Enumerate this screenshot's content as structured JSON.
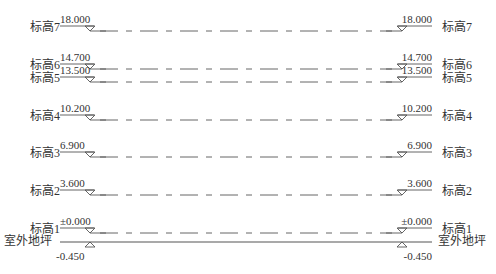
{
  "diagram": {
    "type": "elevation-levels",
    "line_color": "#555555",
    "text_color": "#333333",
    "left_marker_x": 90,
    "right_marker_x": 402,
    "dash_start_x": 100,
    "dash_end_x": 392,
    "levels": [
      {
        "name": "标高7",
        "value": "18.000",
        "y": 31
      },
      {
        "name": "标高6",
        "value": "14.700",
        "y": 69
      },
      {
        "name": "标高5",
        "value": "13.500",
        "y": 82
      },
      {
        "name": "标高4",
        "value": "10.200",
        "y": 120
      },
      {
        "name": "标高3",
        "value": "6.900",
        "y": 157
      },
      {
        "name": "标高2",
        "value": "3.600",
        "y": 195
      },
      {
        "name": "标高1",
        "value": "±0.000",
        "y": 233
      }
    ],
    "ground": {
      "name": "室外地坪",
      "value": "-0.450",
      "y": 242
    }
  }
}
